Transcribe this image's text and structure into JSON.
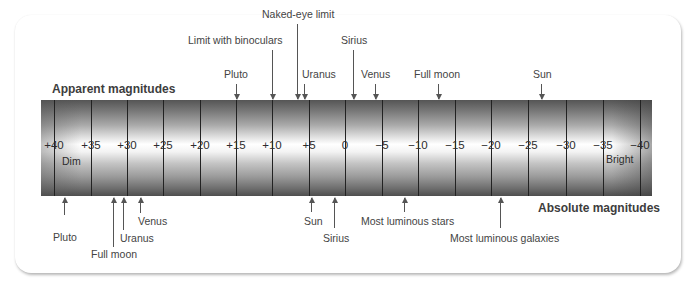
{
  "title_top": "Apparent magnitudes",
  "title_bottom": "Absolute magnitudes",
  "end_labels": {
    "dim": "Dim",
    "bright": "Bright"
  },
  "scale": {
    "ticks": [
      {
        "label": "+40",
        "value": 40,
        "x": 54
      },
      {
        "label": "+35",
        "value": 35,
        "x": 91
      },
      {
        "label": "+30",
        "value": 30,
        "x": 127
      },
      {
        "label": "+25",
        "value": 25,
        "x": 163
      },
      {
        "label": "+20",
        "value": 20,
        "x": 200
      },
      {
        "label": "+15",
        "value": 15,
        "x": 236
      },
      {
        "label": "+10",
        "value": 10,
        "x": 272
      },
      {
        "label": "+5",
        "value": 5,
        "x": 309
      },
      {
        "label": "0",
        "value": 0,
        "x": 345
      },
      {
        "label": "−5",
        "value": -5,
        "x": 382
      },
      {
        "label": "−10",
        "value": -10,
        "x": 418
      },
      {
        "label": "−15",
        "value": -15,
        "x": 455
      },
      {
        "label": "−20",
        "value": -20,
        "x": 491
      },
      {
        "label": "−25",
        "value": -25,
        "x": 528
      },
      {
        "label": "−30",
        "value": -30,
        "x": 566
      },
      {
        "label": "−35",
        "value": -35,
        "x": 603
      },
      {
        "label": "−40",
        "value": -40,
        "x": 640
      }
    ]
  },
  "apparent": [
    {
      "label": "Pluto",
      "x": 236,
      "arrow_top": 84,
      "label_x": 224,
      "label_y": 68
    },
    {
      "label": "Limit with binoculars",
      "x": 272,
      "arrow_top": 50,
      "label_x": 188,
      "label_y": 34
    },
    {
      "label": "Naked-eye limit",
      "x": 297,
      "arrow_top": 24,
      "label_x": 262,
      "label_y": 8
    },
    {
      "label": "Uranus",
      "x": 304,
      "arrow_top": 84,
      "label_x": 302,
      "label_y": 68
    },
    {
      "label": "Sirius",
      "x": 353,
      "arrow_top": 50,
      "label_x": 341,
      "label_y": 34
    },
    {
      "label": "Venus",
      "x": 375,
      "arrow_top": 84,
      "label_x": 361,
      "label_y": 68
    },
    {
      "label": "Full moon",
      "x": 438,
      "arrow_top": 84,
      "label_x": 414,
      "label_y": 68
    },
    {
      "label": "Sun",
      "x": 541,
      "arrow_top": 84,
      "label_x": 533,
      "label_y": 68
    }
  ],
  "absolute": [
    {
      "label": "Pluto",
      "x": 64,
      "arrow_bottom": 215,
      "label_x": 53,
      "label_y": 231
    },
    {
      "label": "Full moon",
      "x": 113,
      "arrow_bottom": 247,
      "label_x": 91,
      "label_y": 248
    },
    {
      "label": "Uranus",
      "x": 123,
      "arrow_bottom": 230,
      "label_x": 120,
      "label_y": 232
    },
    {
      "label": "Venus",
      "x": 140,
      "arrow_bottom": 213,
      "label_x": 138,
      "label_y": 215
    },
    {
      "label": "Sun",
      "x": 311,
      "arrow_bottom": 212,
      "label_x": 304,
      "label_y": 215
    },
    {
      "label": "Sirius",
      "x": 334,
      "arrow_bottom": 228,
      "label_x": 323,
      "label_y": 232
    },
    {
      "label": "Most luminous stars",
      "x": 404,
      "arrow_bottom": 212,
      "label_x": 361,
      "label_y": 215
    },
    {
      "label": "Most luminous galaxies",
      "x": 500,
      "arrow_bottom": 228,
      "label_x": 450,
      "label_y": 232
    }
  ],
  "colors": {
    "bar_dark": "#4e4e4e",
    "bar_light": "#ffffff",
    "tick": "#222222",
    "text": "#3a3a3a"
  }
}
